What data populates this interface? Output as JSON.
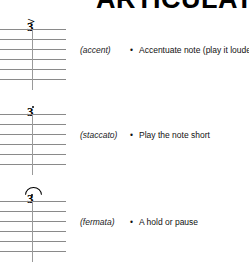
{
  "page": {
    "title": "ARTICULATION"
  },
  "bullet_glyph": "•",
  "rows": [
    {
      "symbol_name": "accent-symbol",
      "symbol_glyph": ">",
      "fret": "3",
      "term": "(accent)",
      "description": "Accentuate note (play it louder)"
    },
    {
      "symbol_name": "staccato-symbol",
      "symbol_glyph": "•",
      "fret": "3",
      "term": "(staccato)",
      "description": "Play the note short"
    },
    {
      "symbol_name": "fermata-symbol",
      "symbol_glyph": "𝄐",
      "fret": "3",
      "term": "(fermata)",
      "description": "A hold or pause"
    }
  ],
  "staff": {
    "line_count": 6,
    "colors": {
      "line": "#8a8a8a",
      "stem": "#9a9a9a",
      "text": "#000000"
    }
  }
}
